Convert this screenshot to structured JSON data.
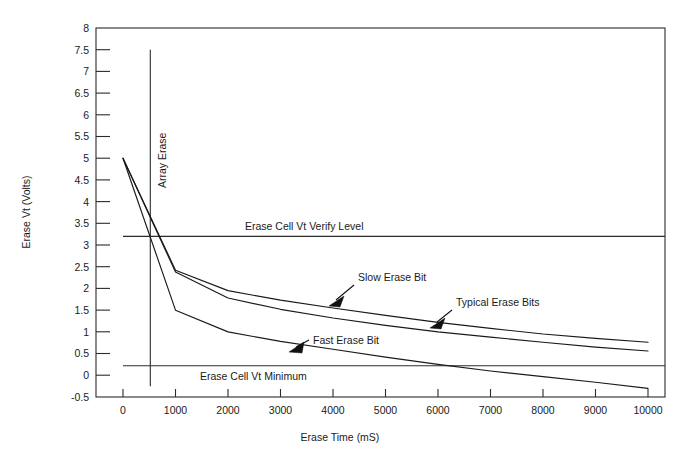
{
  "chart_data": {
    "type": "line",
    "title": "",
    "xlabel": "Erase Time (mS)",
    "ylabel": "Erase Vt (Volts)",
    "xlim": [
      0,
      10000
    ],
    "ylim": [
      -0.5,
      8
    ],
    "grid": false,
    "legend_position": "inline-annotations",
    "xticks": [
      0,
      1000,
      2000,
      3000,
      4000,
      5000,
      6000,
      7000,
      8000,
      9000,
      10000
    ],
    "xtick_labels": [
      "0",
      "1000",
      "2000",
      "3000",
      "4000",
      "5000",
      "6000",
      "7000",
      "8000",
      "9000",
      "10000"
    ],
    "yticks": [
      -0.5,
      0,
      0.5,
      1,
      1.5,
      2,
      2.5,
      3,
      3.5,
      4,
      4.5,
      5,
      5.5,
      6,
      6.5,
      7,
      7.5,
      8
    ],
    "ytick_labels": [
      "-0.5",
      "0",
      "0.5",
      "1",
      "1.5",
      "2",
      "2.5",
      "3",
      "3.5",
      "4",
      "4.5",
      "5",
      "5.5",
      "6",
      "6.5",
      "7",
      "7.5",
      "8"
    ],
    "series": [
      {
        "name": "Slow Erase Bit",
        "x": [
          0,
          1000,
          2000,
          3000,
          4000,
          5000,
          6000,
          7000,
          8000,
          9000,
          10000
        ],
        "values": [
          5.0,
          2.42,
          1.95,
          1.73,
          1.55,
          1.38,
          1.22,
          1.08,
          0.95,
          0.85,
          0.76
        ]
      },
      {
        "name": "Typical Erase Bits",
        "x": [
          0,
          1000,
          2000,
          3000,
          4000,
          5000,
          6000,
          7000,
          8000,
          9000,
          10000
        ],
        "values": [
          5.0,
          2.38,
          1.78,
          1.52,
          1.32,
          1.15,
          1.0,
          0.88,
          0.76,
          0.65,
          0.56
        ]
      },
      {
        "name": "Fast Erase Bit",
        "x": [
          0,
          1000,
          2000,
          3000,
          4000,
          5000,
          6000,
          7000,
          8000,
          9000,
          10000
        ],
        "values": [
          5.0,
          1.5,
          1.0,
          0.78,
          0.6,
          0.42,
          0.25,
          0.1,
          -0.03,
          -0.16,
          -0.3
        ]
      }
    ],
    "reference_lines": [
      {
        "name": "Erase Cell Vt Verify Level",
        "orientation": "horizontal",
        "value": 3.2,
        "label": "Erase Cell Vt Verify Level"
      },
      {
        "name": "Erase Cell Vt Minimum",
        "orientation": "horizontal",
        "value": 0.22,
        "label": "Erase Cell Vt Minimum"
      },
      {
        "name": "Array Erase",
        "orientation": "vertical",
        "value": 520,
        "label": "Array Erase",
        "y_top": 7.5,
        "y_bottom": -0.25
      }
    ],
    "annotations": [
      {
        "name": "Slow Erase Bit",
        "text": "Slow Erase Bit",
        "points_to_x": 4300,
        "points_to_y": 1.48
      },
      {
        "name": "Typical Erase Bits",
        "text": "Typical Erase Bits",
        "points_to_x": 6250,
        "points_to_y": 0.98
      },
      {
        "name": "Fast Erase Bit",
        "text": "Fast Erase Bit",
        "points_to_x": 3950,
        "points_to_y": 0.62
      }
    ],
    "colors": {
      "background": "#ffffff",
      "axis": "#2b2b2b",
      "curve": "#1a1a1a",
      "text": "#1a1a1a"
    }
  }
}
